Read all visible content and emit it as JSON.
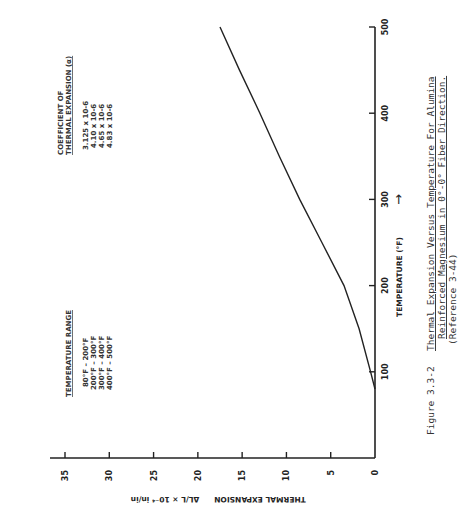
{
  "chart_data": {
    "type": "line",
    "title": "Thermal Expansion Versus Temperature For Alumina Reinforced Magnesium in 0°-0° Fiber Direction.",
    "xlabel": "TEMPERATURE (°F)",
    "ylabel": "THERMAL EXPANSION ΔL/L × 10⁻⁴ in/in",
    "xlim": [
      0,
      500
    ],
    "ylim": [
      0,
      38
    ],
    "x_ticks": [
      100,
      200,
      300,
      400,
      500
    ],
    "y_ticks": [
      0,
      5,
      10,
      15,
      20,
      25,
      30,
      35
    ],
    "grid": false,
    "series": [
      {
        "name": "Alumina reinforced magnesium (0°-0°)",
        "x": [
          80,
          100,
          150,
          200,
          250,
          300,
          350,
          400,
          450,
          500
        ],
        "values": [
          0.0,
          0.5,
          1.8,
          3.5,
          6.0,
          8.5,
          10.8,
          13.0,
          15.3,
          17.5
        ]
      }
    ],
    "annotations": {
      "table": {
        "headers": [
          "TEMPERATURE RANGE",
          "COEFFICIENT OF THERMAL EXPANSION (α)"
        ],
        "rows": [
          [
            "80°F – 200°F",
            "3.125 x 10-6"
          ],
          [
            "200°F – 300°F",
            "4.10 x 10-6"
          ],
          [
            "300°F – 400°F",
            "4.65 x 10-6"
          ],
          [
            "400°F – 500°F",
            "4.83 x 10-6"
          ]
        ]
      }
    }
  },
  "axes": {
    "x_tick_labels": [
      "100",
      "200",
      "300",
      "400",
      "500"
    ],
    "y_tick_labels": [
      "0",
      "5",
      "10",
      "15",
      "20",
      "25",
      "30",
      "35"
    ],
    "x_title": "TEMPERATURE (°F)",
    "x_arrow": "→",
    "y_title_main": "THERMAL EXPANSION",
    "y_title_ratio": "ΔL/L × 10⁻⁴ in/in"
  },
  "table": {
    "header_left": "TEMPERATURE RANGE",
    "header_right_1": "COEFFICIENT OF",
    "header_right_2": "THERMAL EXPANSION (α)",
    "rows": [
      {
        "range": "80°F  –  200°F",
        "coef": "3.125  x  10-6"
      },
      {
        "range": "200°F  –  300°F",
        "coef": "4.10  x  10-6"
      },
      {
        "range": "300°F  –  400°F",
        "coef": "4.65  x  10-6"
      },
      {
        "range": "400°F  –  500°F",
        "coef": "4.83  x  10-6"
      }
    ]
  },
  "caption": {
    "figure_number": "Figure 3.3-2",
    "line1": "Thermal Expansion Versus Temperature For Alumina",
    "line2": "Reinforced Magnesium in 0°-0° Fiber Direction.",
    "line3": "(Reference 3-44)"
  }
}
